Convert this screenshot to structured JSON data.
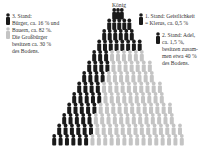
{
  "diagram": {
    "title": "König",
    "colors": {
      "dark": "#1a1a1a",
      "light": "#c4c4c4",
      "text": "#333333"
    },
    "legend": {
      "third_estate": {
        "lines": [
          "3. Stand:",
          "Bürger, ca. 16 % und",
          "Bauern, ca. 82 %.",
          "Die Großbürger",
          "besitzen ca. 30 %",
          "des Bodens."
        ]
      },
      "first_estate": {
        "lines": [
          "1. Stand: Geistlichkeit",
          "= Klerus, ca. 0,5 %"
        ]
      },
      "second_estate": {
        "lines": [
          "2. Stand: Adel,",
          "ca. 1,5 %,",
          "besitzen zusam-",
          "men etwa 40 %",
          "des Bodens."
        ]
      }
    }
  }
}
